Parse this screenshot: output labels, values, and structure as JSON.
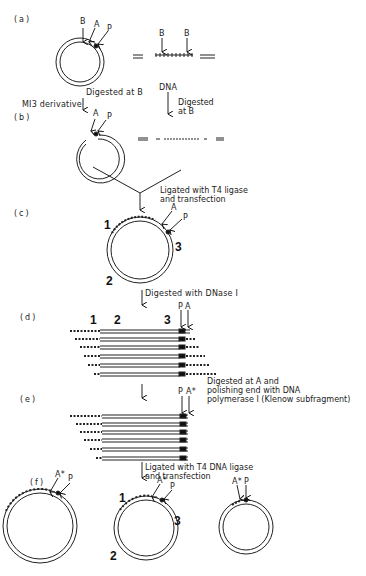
{
  "figure": {
    "steps": {
      "a": "(a)",
      "b": "(b)",
      "c": "(c)",
      "d": "(d)",
      "e": "(e)",
      "f": "(f)"
    },
    "sites": {
      "B": "B",
      "A": "A",
      "P": "P",
      "A_star": "A*"
    },
    "regions": {
      "r1": "1",
      "r2": "2",
      "r3": "3"
    },
    "labels": {
      "m13": "MI3 derivative",
      "digested_at_b": "Digested at B",
      "dna": "DNA",
      "digested_at_b_dna": "Digested\nat B",
      "ligated_t4": "Ligated with T4 ligase\nand transfection",
      "dnase": "Digested with DNase I",
      "digested_at_a": "Digested at A and\npolishing end with DNA\npolymerase I (Klenow subfragment)",
      "ligated_t4_dna": "Ligated with T4 DNA ligase\nand transfection"
    }
  }
}
